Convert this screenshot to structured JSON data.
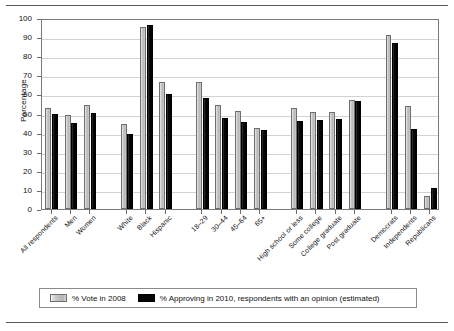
{
  "chart_data": {
    "type": "bar",
    "title": "",
    "subtitle": "",
    "xlabel": "",
    "ylabel": "Percentage",
    "ylim": [
      0,
      100
    ],
    "yticks": [
      0,
      10,
      20,
      30,
      40,
      50,
      60,
      70,
      80,
      90,
      100
    ],
    "grid": true,
    "legend_position": "bottom",
    "categories": [
      "All respondents",
      "Men",
      "Women",
      "White",
      "Black",
      "Hispanic",
      "18–29",
      "30–44",
      "45–64",
      "65+",
      "High school or less",
      "Some college",
      "College graduate",
      "Post graduate",
      "Democrats",
      "Independents",
      "Republicans"
    ],
    "group_gaps_after": [
      "Women",
      "Hispanic",
      "65+",
      "Post graduate"
    ],
    "series": [
      {
        "name": "% Vote in 2008",
        "color": "#c4c4c4",
        "values": [
          52.9,
          49.0,
          54.7,
          44.5,
          95.5,
          66.5,
          66.4,
          54.4,
          51.5,
          42.5,
          52.8,
          51.0,
          51.0,
          57.0,
          91.0,
          54.0,
          7.0
        ]
      },
      {
        "name": "% Approving in 2010, respondents with an opinion (estimated)",
        "color": "#000000",
        "values": [
          50.0,
          45.0,
          50.3,
          39.4,
          96.5,
          60.0,
          58.3,
          47.5,
          45.6,
          41.5,
          46.0,
          46.5,
          47.0,
          56.5,
          87.0,
          42.0,
          11.0
        ]
      }
    ],
    "legend": [
      {
        "label": "% Vote in 2008",
        "swatch": "light-gray"
      },
      {
        "label": "% Approving in 2010, respondents with an opinion (estimated)",
        "swatch": "black"
      }
    ]
  }
}
